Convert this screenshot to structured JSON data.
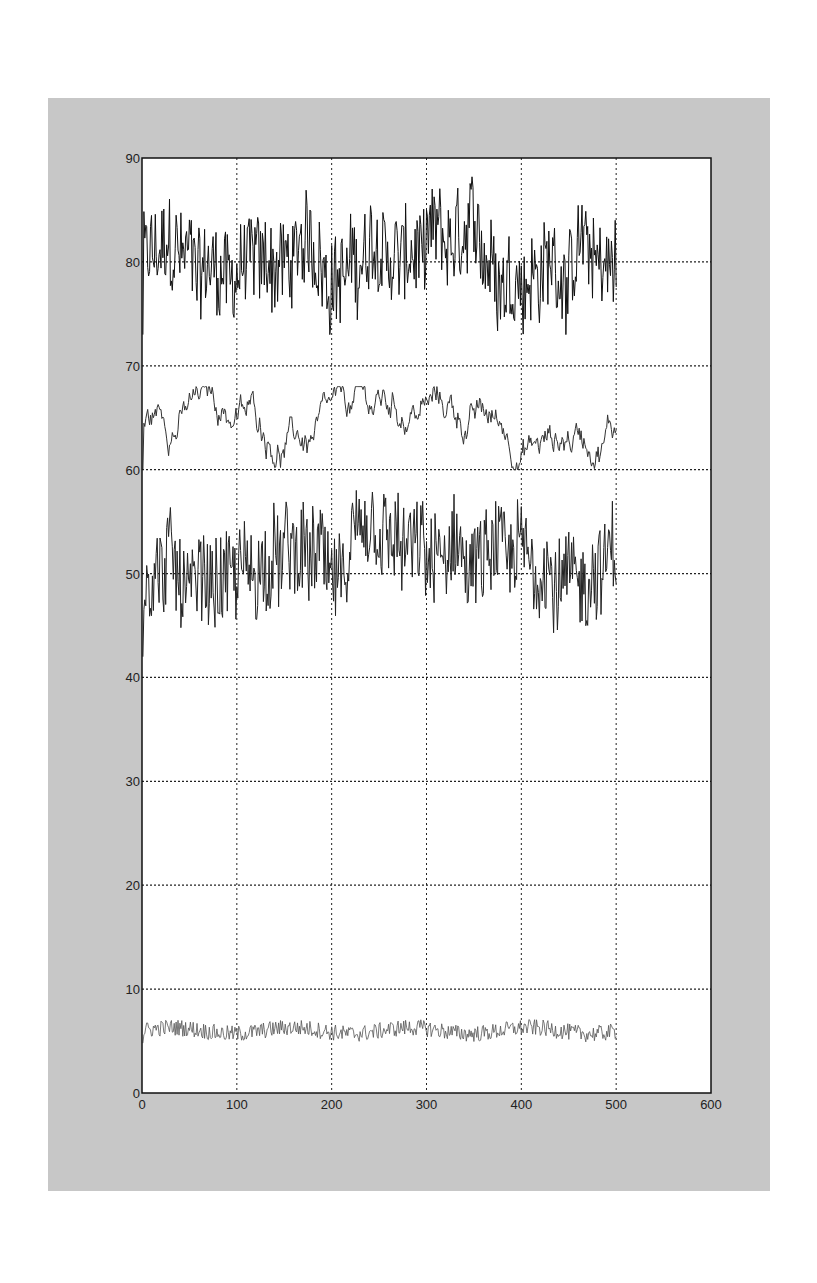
{
  "chart_data": {
    "type": "line",
    "title": "",
    "xlabel": "",
    "ylabel": "",
    "xlim": [
      0,
      600
    ],
    "ylim": [
      0,
      90
    ],
    "x_ticks": [
      "0",
      "100",
      "200",
      "300",
      "400",
      "500",
      "600"
    ],
    "y_ticks": [
      "0",
      "10",
      "20",
      "30",
      "40",
      "50",
      "60",
      "70",
      "80",
      "90"
    ],
    "grid": true,
    "legend": null,
    "n_points": 500,
    "series": [
      {
        "name": "series-1",
        "mean": 80,
        "min": 73,
        "max": 89,
        "noise": "high",
        "color": "#111111"
      },
      {
        "name": "series-2",
        "mean": 64.5,
        "min": 60,
        "max": 68,
        "noise": "smooth",
        "color": "#333333"
      },
      {
        "name": "series-3",
        "mean": 50.5,
        "min": 42,
        "max": 58,
        "noise": "high",
        "color": "#222222"
      },
      {
        "name": "series-4",
        "mean": 6,
        "min": 4.8,
        "max": 7.3,
        "noise": "low",
        "color": "#555555"
      }
    ]
  },
  "colors": {
    "panel_bg": "#c7c7c7",
    "plot_bg": "#ffffff",
    "axis": "#111111",
    "grid": "#222222"
  }
}
